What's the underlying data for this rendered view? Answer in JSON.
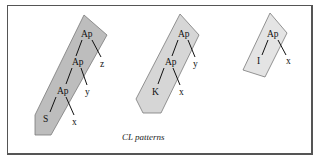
{
  "diagram": {
    "caption": "CL patterns",
    "colors": {
      "border": "#555555",
      "pattern_s_fill": "#bdbdbd",
      "pattern_k_fill": "#d6d6d6",
      "pattern_i_fill": "#e4e4e4",
      "shape_stroke": "#7a7a7a",
      "edge": "#111111"
    },
    "patterns": [
      {
        "name": "S pattern",
        "nodes": {
          "ap_top": "Ap",
          "ap_mid": "Ap",
          "ap_low": "Ap",
          "combinator": "S",
          "arg_z": "z",
          "arg_y": "y",
          "arg_x": "x"
        }
      },
      {
        "name": "K pattern",
        "nodes": {
          "ap_top": "Ap",
          "ap_mid": "Ap",
          "combinator": "K",
          "arg_y": "y",
          "arg_x": "x"
        }
      },
      {
        "name": "I pattern",
        "nodes": {
          "ap_top": "Ap",
          "combinator": "I",
          "arg_x": "x"
        }
      }
    ]
  }
}
